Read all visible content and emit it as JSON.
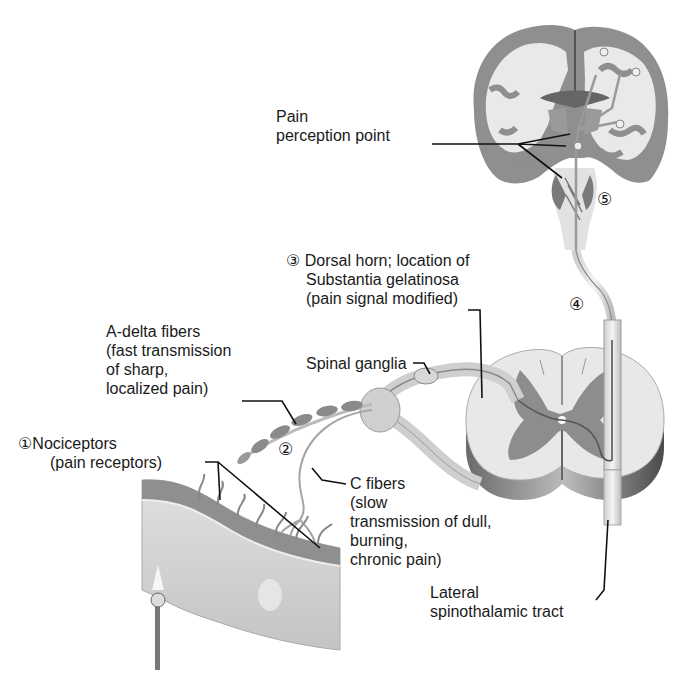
{
  "diagram": {
    "type": "anatomical pain pathway illustration",
    "colors": {
      "background": "#ffffff",
      "gray_matter": "#8a8a8a",
      "white_matter": "#e6e6e6",
      "skin_layer": "#9a9a9a",
      "tissue": "#d4d4d4",
      "text": "#1a1a1a",
      "leader_line": "#111111"
    }
  },
  "labels": {
    "pain_perception": {
      "lines": [
        "Pain",
        "perception point"
      ]
    },
    "dorsal_horn": {
      "step": "③",
      "lines": [
        "Dorsal horn; location of",
        "Substantia gelatinosa",
        "(pain signal modified)"
      ]
    },
    "step4": {
      "step": "④"
    },
    "step5": {
      "step": "⑤"
    },
    "a_delta": {
      "lines": [
        "A-delta fibers",
        "(fast transmission",
        "of sharp,",
        "localized pain)"
      ]
    },
    "spinal_ganglia": {
      "lines": [
        "Spinal ganglia"
      ]
    },
    "nociceptors": {
      "step": "①",
      "lines": [
        "Nociceptors",
        "(pain receptors)"
      ]
    },
    "step2": {
      "step": "②"
    },
    "c_fibers": {
      "lines": [
        "C fibers",
        "(slow",
        "transmission of dull,",
        "burning,",
        "chronic pain)"
      ]
    },
    "spinothalamic": {
      "lines": [
        "Lateral",
        "spinothalamic tract"
      ]
    }
  }
}
